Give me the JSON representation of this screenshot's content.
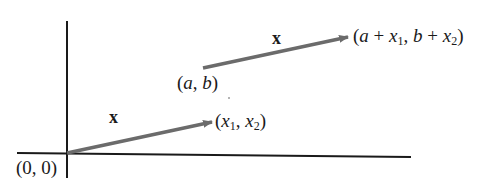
{
  "diagram": {
    "colors": {
      "axes": "#1a1a1a",
      "vector": "#6b6b6b",
      "text": "#1a1a1a"
    },
    "origin_label": "(0, 0)",
    "vector_label": "x",
    "lower_vector": {
      "label": "x",
      "tail": "(0, 0)",
      "head_label_parts": {
        "open": "(",
        "x": "x",
        "s1": "1",
        "comma": ", ",
        "x2": "x",
        "s2": "2",
        "close": ")"
      }
    },
    "upper_vector": {
      "label": "x",
      "tail_label": {
        "open": "(",
        "a": "a",
        "comma": ", ",
        "b": "b",
        "close": ")"
      },
      "head_label_parts": {
        "p1": "(",
        "a": "a",
        "plus1": " + ",
        "x": "x",
        "s1": "1",
        "comma": ", ",
        "b": "b",
        "plus2": " + ",
        "x2": "x",
        "s2": "2",
        "close": ")"
      }
    }
  }
}
